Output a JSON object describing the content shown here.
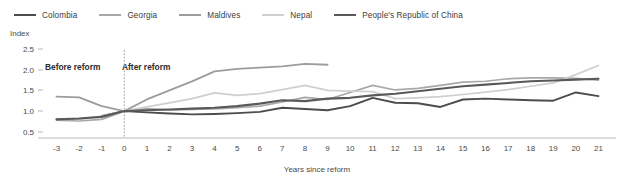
{
  "chart_data": {
    "type": "line",
    "title": "",
    "xlabel": "Years since reform",
    "ylabel": "Index",
    "xlim": [
      -3.6,
      21.6
    ],
    "ylim": [
      0.35,
      2.62
    ],
    "grid": false,
    "legend_position": "top-left",
    "yticks": [
      "0.5",
      "1.0",
      "1.5",
      "2.0",
      "2.5"
    ],
    "ytick_values": [
      0.5,
      1.0,
      1.5,
      2.0,
      2.5
    ],
    "xticks": [
      "-3",
      "-2",
      "-1",
      "0",
      "1",
      "2",
      "3",
      "4",
      "5",
      "6",
      "7",
      "8",
      "9",
      "10",
      "11",
      "12",
      "13",
      "14",
      "15",
      "16",
      "17",
      "18",
      "19",
      "20",
      "21"
    ],
    "xtick_values": [
      -3,
      -2,
      -1,
      0,
      1,
      2,
      3,
      4,
      5,
      6,
      7,
      8,
      9,
      10,
      11,
      12,
      13,
      14,
      15,
      16,
      17,
      18,
      19,
      20,
      21
    ],
    "annotations": [
      {
        "text": "Before reform",
        "x": -2.0,
        "y": 2.18
      },
      {
        "text": "After reform",
        "x": 0.6,
        "y": 2.18
      }
    ],
    "reference_line": {
      "x": 0,
      "style": "dotted",
      "color": "#9a9a9a"
    },
    "series": [
      {
        "name": "Colombia",
        "color": "#4c4c4c",
        "width": 1.9,
        "x": [
          -1,
          0,
          1,
          2,
          3,
          4,
          5,
          6,
          7,
          8,
          9,
          10,
          11,
          12,
          13,
          14,
          15,
          16,
          17,
          18,
          19,
          20,
          21
        ],
        "values": [
          0.88,
          1.0,
          0.97,
          0.94,
          0.92,
          0.93,
          0.95,
          0.98,
          1.08,
          1.05,
          1.02,
          1.12,
          1.32,
          1.2,
          1.19,
          1.1,
          1.28,
          1.3,
          1.28,
          1.26,
          1.25,
          1.45,
          1.36
        ]
      },
      {
        "name": "Georgia",
        "color": "#a8a8a8",
        "width": 1.7,
        "x": [
          -3,
          -2,
          -1,
          0,
          1,
          2,
          3,
          4,
          5,
          6,
          7,
          8,
          9,
          10,
          11,
          12,
          13,
          14,
          15,
          16,
          17,
          18,
          19,
          20,
          21
        ],
        "values": [
          0.78,
          0.76,
          0.8,
          1.0,
          1.06,
          1.03,
          1.04,
          1.05,
          1.08,
          1.12,
          1.22,
          1.33,
          1.28,
          1.45,
          1.62,
          1.51,
          1.55,
          1.62,
          1.7,
          1.72,
          1.78,
          1.8,
          1.8,
          1.79,
          1.75
        ]
      },
      {
        "name": "Maldives",
        "color": "#9d9d9d",
        "width": 1.9,
        "x": [
          -3,
          -2,
          -1,
          0,
          1,
          2,
          3,
          4,
          5,
          6,
          7,
          8,
          9
        ],
        "values": [
          1.35,
          1.33,
          1.12,
          1.0,
          1.28,
          1.5,
          1.72,
          1.96,
          2.02,
          2.05,
          2.08,
          2.14,
          2.12
        ]
      },
      {
        "name": "Nepal",
        "color": "#cfcfcf",
        "width": 1.7,
        "x": [
          -3,
          -2,
          -1,
          0,
          1,
          2,
          3,
          4,
          5,
          6,
          7,
          8,
          9,
          10,
          11,
          12,
          13,
          14,
          15,
          16,
          17,
          18,
          19,
          20,
          21
        ],
        "values": [
          0.82,
          0.8,
          0.88,
          1.0,
          1.1,
          1.2,
          1.3,
          1.44,
          1.38,
          1.42,
          1.52,
          1.62,
          1.5,
          1.48,
          1.47,
          1.3,
          1.32,
          1.35,
          1.4,
          1.46,
          1.52,
          1.6,
          1.68,
          1.88,
          2.1
        ]
      },
      {
        "name": "People's Republic of China",
        "color": "#595959",
        "width": 2.1,
        "x": [
          -3,
          -2,
          -1,
          0,
          1,
          2,
          3,
          4,
          5,
          6,
          7,
          8,
          9,
          10,
          11,
          12,
          13,
          14,
          15,
          16,
          17,
          18,
          19,
          20,
          21
        ],
        "values": [
          0.8,
          0.82,
          0.86,
          1.0,
          1.02,
          1.04,
          1.06,
          1.08,
          1.12,
          1.18,
          1.26,
          1.24,
          1.3,
          1.32,
          1.38,
          1.42,
          1.48,
          1.54,
          1.6,
          1.64,
          1.68,
          1.72,
          1.74,
          1.76,
          1.78
        ]
      }
    ]
  },
  "legend": {
    "items": [
      {
        "label": "Colombia",
        "color": "#4c4c4c"
      },
      {
        "label": "Georgia",
        "color": "#a8a8a8"
      },
      {
        "label": "Maldives",
        "color": "#9d9d9d"
      },
      {
        "label": "Nepal",
        "color": "#cfcfcf"
      },
      {
        "label": "People's Republic of China",
        "color": "#595959"
      }
    ]
  }
}
